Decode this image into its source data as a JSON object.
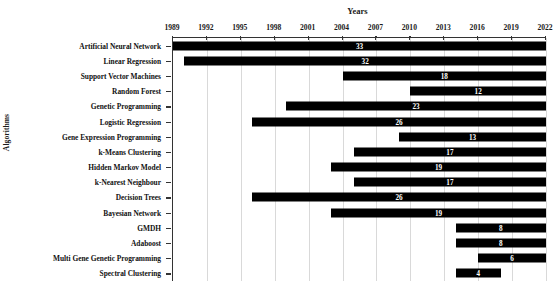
{
  "chart_data": {
    "type": "bar",
    "orientation": "horizontal",
    "subtype": "gantt-range",
    "title": "",
    "xlabel": "Years",
    "ylabel": "Algorithms",
    "xlim": [
      1989,
      2022
    ],
    "xticks": [
      1989,
      1992,
      1995,
      1998,
      2001,
      2004,
      2007,
      2010,
      2013,
      2016,
      2019,
      2022
    ],
    "xtick_labels": [
      "1989",
      "1992",
      "1995",
      "1998",
      "2001",
      "2004",
      "2007",
      "2010",
      "2013",
      "2016",
      "2019",
      "2022"
    ],
    "grid": true,
    "legend": false,
    "axis_position": "top",
    "bar_color": "#000000",
    "label_color": "#ffffff",
    "categories": [
      "Artificial Neural Network",
      "Linear Regression",
      "Support Vector Machines",
      "Random Forest",
      "Genetic Programming",
      "Logistic Regression",
      "Gene Expression Programming",
      "k-Means Clustering",
      "Hidden Markov Model",
      "k-Nearest Neighbour",
      "Decision Trees",
      "Bayesian Network",
      "GMDH",
      "Adaboost",
      "Multi Gene Genetic Programming",
      "Spectral Clustering"
    ],
    "bars": [
      {
        "category": "Artificial Neural Network",
        "start": 1989,
        "end": 2022,
        "value": 33,
        "label": "33"
      },
      {
        "category": "Linear Regression",
        "start": 1990,
        "end": 2022,
        "value": 32,
        "label": "32"
      },
      {
        "category": "Support Vector Machines",
        "start": 2004,
        "end": 2022,
        "value": 18,
        "label": "18"
      },
      {
        "category": "Random Forest",
        "start": 2010,
        "end": 2022,
        "value": 12,
        "label": "12"
      },
      {
        "category": "Genetic Programming",
        "start": 1999,
        "end": 2022,
        "value": 23,
        "label": "23"
      },
      {
        "category": "Logistic Regression",
        "start": 1996,
        "end": 2022,
        "value": 26,
        "label": "26"
      },
      {
        "category": "Gene Expression Programming",
        "start": 2009,
        "end": 2022,
        "value": 13,
        "label": "13"
      },
      {
        "category": "k-Means Clustering",
        "start": 2005,
        "end": 2022,
        "value": 17,
        "label": "17"
      },
      {
        "category": "Hidden Markov Model",
        "start": 2003,
        "end": 2022,
        "value": 19,
        "label": "19"
      },
      {
        "category": "k-Nearest Neighbour",
        "start": 2005,
        "end": 2022,
        "value": 17,
        "label": "17"
      },
      {
        "category": "Decision Trees",
        "start": 1996,
        "end": 2022,
        "value": 26,
        "label": "26"
      },
      {
        "category": "Bayesian Network",
        "start": 2003,
        "end": 2022,
        "value": 19,
        "label": "19"
      },
      {
        "category": "GMDH",
        "start": 2014,
        "end": 2022,
        "value": 8,
        "label": "8"
      },
      {
        "category": "Adaboost",
        "start": 2014,
        "end": 2022,
        "value": 8,
        "label": "8"
      },
      {
        "category": "Multi Gene Genetic Programming",
        "start": 2016,
        "end": 2022,
        "value": 6,
        "label": "6"
      },
      {
        "category": "Spectral Clustering",
        "start": 2014,
        "end": 2018,
        "value": 4,
        "label": "4"
      }
    ]
  }
}
